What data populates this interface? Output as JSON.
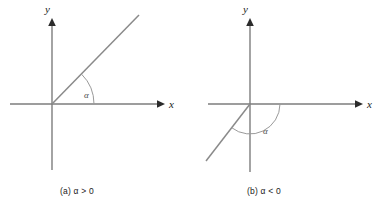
{
  "figure": {
    "background_color": "#ffffff",
    "line_color": "#7d7d7d",
    "arc_color": "#9a9a9a",
    "arrow_color": "#2b2b2b",
    "label_color": "#1a1a1a"
  },
  "panels": [
    {
      "id": "panel-a",
      "caption": "(a) α > 0",
      "caption_parts": {
        "tag": "(a)",
        "symbol": "α",
        "relation": ">",
        "value": "0"
      },
      "axes": {
        "x_label": "x",
        "y_label": "y",
        "origin": {
          "x": 52,
          "y": 104
        },
        "x_start": {
          "x": 10,
          "y": 104
        },
        "x_end": {
          "x": 163,
          "y": 104
        },
        "y_top": {
          "x": 52,
          "y": 20
        },
        "y_bottom": {
          "x": 52,
          "y": 170
        },
        "x_label_pos": {
          "x": 172,
          "y": 107
        },
        "y_label_pos": {
          "x": 46,
          "y": 12
        }
      },
      "ray": {
        "from": {
          "x": 52,
          "y": 104
        },
        "to": {
          "x": 139,
          "y": 15
        },
        "angle_degrees": 45
      },
      "angle_arc": {
        "radius": 42,
        "start_degrees": 0,
        "end_degrees": 45,
        "sweep": "counterclockwise",
        "label": "α",
        "label_pos": {
          "x": 87,
          "y": 95
        }
      }
    },
    {
      "id": "panel-b",
      "caption": "(b) α < 0",
      "caption_parts": {
        "tag": "(b)",
        "symbol": "α",
        "relation": "<",
        "value": "0"
      },
      "axes": {
        "x_label": "x",
        "y_label": "y",
        "origin": {
          "x": 250,
          "y": 104
        },
        "x_start": {
          "x": 208,
          "y": 104
        },
        "x_end": {
          "x": 361,
          "y": 104
        },
        "y_top": {
          "x": 250,
          "y": 20
        },
        "y_bottom": {
          "x": 250,
          "y": 172
        },
        "x_label_pos": {
          "x": 370,
          "y": 107
        },
        "y_label_pos": {
          "x": 244,
          "y": 12
        }
      },
      "ray": {
        "from": {
          "x": 250,
          "y": 104
        },
        "to": {
          "x": 206,
          "y": 161
        },
        "angle_degrees": -128
      },
      "angle_arc": {
        "radius": 30,
        "start_degrees": 0,
        "end_degrees": -128,
        "sweep": "clockwise",
        "label": "α",
        "label_pos": {
          "x": 266,
          "y": 131
        }
      }
    }
  ]
}
